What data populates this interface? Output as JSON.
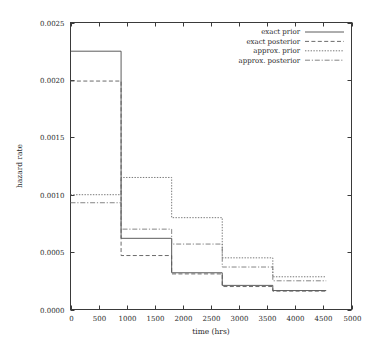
{
  "chart_data": {
    "type": "line",
    "subtype": "step-post",
    "title": "",
    "xlabel": "time (hrs)",
    "ylabel": "hazard rate",
    "xlim": [
      0,
      5000
    ],
    "ylim": [
      0.0,
      0.0025
    ],
    "xticks": [
      0,
      500,
      1000,
      1500,
      2000,
      2500,
      3000,
      3500,
      4000,
      4500,
      5000
    ],
    "xticklabels": [
      "0",
      "500",
      "1000",
      "1500",
      "2000",
      "2500",
      "3000",
      "3500",
      "4000",
      "4500",
      "5000"
    ],
    "yticks": [
      0.0,
      0.0005,
      0.001,
      0.0015,
      0.002,
      0.0025
    ],
    "yticklabels": [
      "0.0000",
      "0.0005",
      "0.0010",
      "0.0015",
      "0.0020",
      "0.0025"
    ],
    "grid": false,
    "legend_position": "top-right",
    "bin_edges": [
      0,
      900,
      1800,
      2700,
      3600,
      4550
    ],
    "series": [
      {
        "name": "exact prior",
        "style": "solid",
        "color": "#4a4a4a",
        "values": [
          0.00225,
          0.00062,
          0.00032,
          0.00021,
          0.000165
        ]
      },
      {
        "name": "exact posterior",
        "style": "dashed",
        "color": "#5a5a5a",
        "values": [
          0.00199,
          0.00047,
          0.00031,
          0.0002,
          0.00016
        ]
      },
      {
        "name": "approx. prior",
        "style": "dotted",
        "color": "#6a6a6a",
        "values": [
          0.001,
          0.00115,
          0.0008,
          0.00045,
          0.000285
        ]
      },
      {
        "name": "approx. posterior",
        "style": "dashdot",
        "color": "#777777",
        "values": [
          0.00093,
          0.0007,
          0.00057,
          0.00037,
          0.00025
        ]
      }
    ]
  },
  "legend": {
    "entries": [
      {
        "label": "exact prior"
      },
      {
        "label": "exact posterior"
      },
      {
        "label": "approx. prior"
      },
      {
        "label": "approx. posterior"
      }
    ]
  }
}
